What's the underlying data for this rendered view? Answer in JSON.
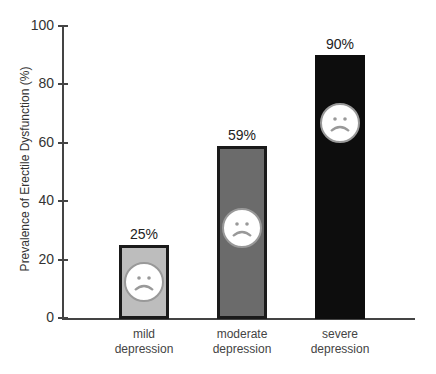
{
  "chart_data": {
    "type": "bar",
    "title": "",
    "xlabel": "",
    "ylabel": "Prevalence of Erectile Dysfunction (%)",
    "ylim": [
      0,
      100
    ],
    "yticks": [
      "0",
      "20",
      "40",
      "60",
      "80",
      "100"
    ],
    "categories": [
      "mild depression",
      "moderate depression",
      "severe depression"
    ],
    "category_lines": [
      [
        "mild",
        "depression"
      ],
      [
        "moderate",
        "depression"
      ],
      [
        "severe",
        "depression"
      ]
    ],
    "values": [
      25,
      59,
      90
    ],
    "value_labels": [
      "25%",
      "59%",
      "90%"
    ],
    "colors": [
      "#bdbdbd",
      "#6b6b6b",
      "#0d0d0d"
    ],
    "annotations": [
      "sad-face icon on each bar"
    ],
    "grid": false,
    "legend": null
  }
}
